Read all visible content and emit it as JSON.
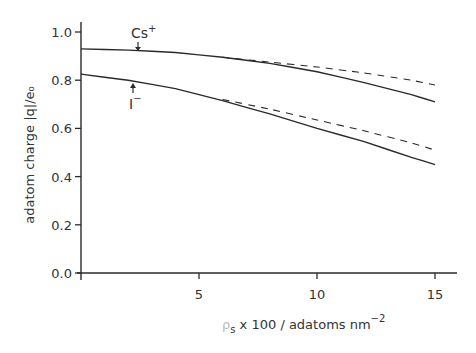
{
  "chart_data": {
    "type": "line",
    "title": "",
    "xlabel": "ρs x 100 / adatoms nm⁻²",
    "ylabel": "adatom charge |q|/e₀",
    "xlim": [
      0,
      16
    ],
    "ylim": [
      0.0,
      1.0
    ],
    "x_ticks": [
      5,
      10,
      15
    ],
    "x_tick_labels": [
      "5",
      "10",
      "15"
    ],
    "y_ticks": [
      0.0,
      0.2,
      0.4,
      0.6,
      0.8,
      1.0
    ],
    "y_tick_labels": [
      "0.0",
      "0.2",
      "0.4",
      "0.6",
      "0.8",
      "1.0"
    ],
    "grid": false,
    "legend": null,
    "annotations": [
      {
        "text": "Cs⁺",
        "x": 2.3,
        "y": 0.93
      },
      {
        "text": "I⁻",
        "x": 2.3,
        "y": 0.79
      }
    ],
    "series": [
      {
        "name": "Cs+ (solid)",
        "style": "solid",
        "x": [
          0,
          2,
          4,
          6,
          8,
          10,
          12,
          14,
          15
        ],
        "y": [
          0.93,
          0.925,
          0.915,
          0.895,
          0.87,
          0.835,
          0.79,
          0.74,
          0.71
        ]
      },
      {
        "name": "Cs+ (dashed)",
        "style": "dashed",
        "x": [
          6,
          8,
          10,
          12,
          14,
          15
        ],
        "y": [
          0.895,
          0.875,
          0.855,
          0.83,
          0.8,
          0.78
        ]
      },
      {
        "name": "I- (solid)",
        "style": "solid",
        "x": [
          0,
          2,
          4,
          6,
          8,
          10,
          12,
          14,
          15
        ],
        "y": [
          0.825,
          0.8,
          0.765,
          0.715,
          0.66,
          0.6,
          0.545,
          0.48,
          0.45
        ]
      },
      {
        "name": "I- (dashed)",
        "style": "dashed",
        "x": [
          6,
          8,
          10,
          12,
          14,
          15
        ],
        "y": [
          0.72,
          0.68,
          0.635,
          0.59,
          0.54,
          0.51
        ]
      }
    ]
  },
  "labels": {
    "ylabel": "adatom  charge  |q|/e₀",
    "xlabel_prefix": "ρ",
    "xlabel_sub": "s",
    "xlabel_main": " x 100 / adatoms nm",
    "xlabel_sup": "−2",
    "cs_label": "Cs",
    "cs_sup": "+",
    "i_label": "I",
    "i_sup": "−"
  },
  "colors": {
    "ink": "#2a2a2a",
    "background": "#ffffff"
  }
}
